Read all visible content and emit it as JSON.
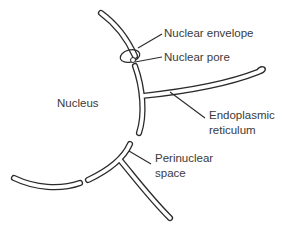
{
  "diagram": {
    "type": "cell-structure",
    "labels": {
      "nucleus": "Nucleus",
      "nuclear_envelope": "Nuclear envelope",
      "nuclear_pore": "Nuclear pore",
      "endoplasmic_reticulum_line1": "Endoplasmic",
      "endoplasmic_reticulum_line2": "reticulum",
      "perinuclear_line1": "Perinuclear",
      "perinuclear_line2": "space"
    },
    "colors": {
      "stroke": "#2b2b2b",
      "text": "#3a3a3a",
      "background": "#ffffff"
    }
  }
}
